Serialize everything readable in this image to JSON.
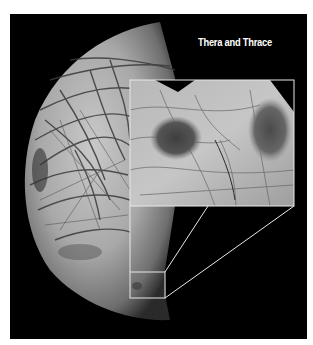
{
  "figure": {
    "label": "Thera and Thrace",
    "background_color": "#000000",
    "annotation_color": "#e8e8e8"
  },
  "inset": {
    "bounds": {
      "x": 130,
      "y": 80,
      "width": 164,
      "height": 126
    },
    "features": [
      "dark chaos region (Thera)",
      "dark chaos region (Thrace)"
    ]
  },
  "locator_box": {
    "bounds": {
      "x": 130,
      "y": 272,
      "width": 35,
      "height": 26
    }
  }
}
